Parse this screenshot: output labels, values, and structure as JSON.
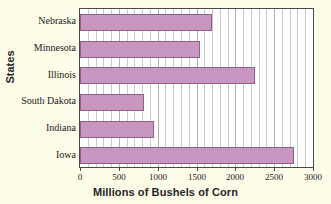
{
  "chart_data": {
    "type": "bar",
    "orientation": "horizontal",
    "title": "",
    "xlabel": "Millions of Bushels of Corn",
    "ylabel": "States",
    "categories": [
      "Nebraska",
      "Minnesota",
      "Illinois",
      "South Dakota",
      "Indiana",
      "Iowa"
    ],
    "values": [
      1700,
      1550,
      2250,
      825,
      950,
      2750
    ],
    "xlim": [
      0,
      3000
    ],
    "xticks": [
      0,
      500,
      1000,
      1500,
      2000,
      2500,
      3000
    ],
    "xtick_labels": [
      "0",
      "500",
      "1000",
      "1500",
      "2000",
      "2500",
      "3000"
    ],
    "grid": "vertical-minor-every-100",
    "legend": "none",
    "bar_color": "#c896c0",
    "bar_edge_color": "#8d5f89",
    "plot_background": "#ffffff",
    "figure_background": "#fdfce8",
    "gridline_color": "#c9c9c9",
    "axis_color": "#4a4a4a"
  }
}
